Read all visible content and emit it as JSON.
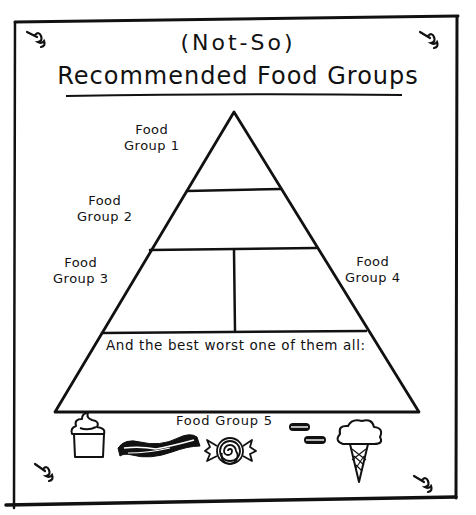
{
  "header": {
    "subtitle": "(Not-So)",
    "title": "Recommended Food Groups"
  },
  "pyramid": {
    "levels": [
      {
        "id": "food-group-1",
        "line1": "Food",
        "line2": "Group 1"
      },
      {
        "id": "food-group-2",
        "line1": "Food",
        "line2": "Group 2"
      },
      {
        "id": "food-group-3",
        "line1": "Food",
        "line2": "Group 3"
      },
      {
        "id": "food-group-4",
        "line1": "Food",
        "line2": "Group 4"
      }
    ],
    "base_caption": "And the best worst one of them all:"
  },
  "food_group_5": {
    "label": "Food Group 5",
    "icons": [
      "cupcake-icon",
      "bacon-icon",
      "candy-icon",
      "cookies-icon",
      "ice-cream-cone-icon"
    ]
  },
  "decorations": {
    "pushpins": [
      "top-left",
      "top-right",
      "bottom-left",
      "bottom-right"
    ],
    "ink_color": "#111111",
    "paper_color": "#ffffff"
  }
}
